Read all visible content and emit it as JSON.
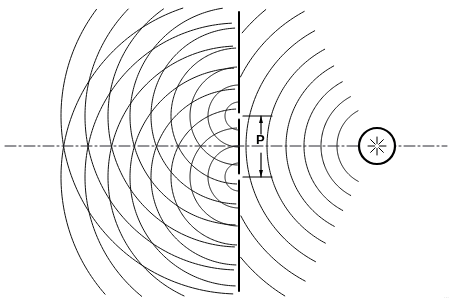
{
  "figure": {
    "kind": "optics-diagram",
    "background_color": "#ffffff",
    "line_color": "#000000"
  },
  "labels": {
    "slit_separation": "P",
    "corner_mark": "···"
  },
  "chart_data": {
    "type": "diagram",
    "grid": false,
    "legend": false,
    "xlim": [
      0,
      451
    ],
    "ylim": [
      0,
      301
    ],
    "axis_line": {
      "name": "optical-axis",
      "style": "dash-dot",
      "y": 146,
      "x_start": 5,
      "x_end": 447,
      "color": "#2b2b33",
      "width": 1
    },
    "source": {
      "name": "point-light-source",
      "cx": 377,
      "cy": 146,
      "radius": 18,
      "circle_width": 2.2,
      "starburst_rays": 8,
      "starburst_inner": 2.5,
      "starburst_outer": 9,
      "color": "#000000"
    },
    "barrier": {
      "name": "slit-barrier",
      "x": 239,
      "y_top": 12,
      "y_bottom": 291,
      "width": 2.0,
      "color": "#000000",
      "slits": [
        {
          "name": "slit-upper",
          "y": 116,
          "half_gap": 3.5
        },
        {
          "name": "slit-lower",
          "y": 177,
          "half_gap": 3.5
        }
      ]
    },
    "incident_wavefronts": {
      "name": "incident-spherical-waves",
      "description": "Arcs centered on the source, travelling right-to-left toward the barrier",
      "center_x": 377,
      "center_y": 146,
      "radii": [
        40,
        56,
        73,
        91,
        110,
        131,
        153,
        176
      ],
      "angle_start_deg": 118,
      "angle_end_deg": 242,
      "line_width": 1.0,
      "color": "#111111"
    },
    "diffracted_wavefronts": {
      "name": "diffracted-circular-waves",
      "description": "Two families of concentric circular wavelets emitted from each slit, interfering to the left of the barrier",
      "sources": [
        {
          "name": "wavelet-origin-upper",
          "cx": 239,
          "cy": 116
        },
        {
          "name": "wavelet-origin-lower",
          "cx": 239,
          "cy": 177
        }
      ],
      "radii": [
        14,
        31,
        49,
        68,
        88,
        109,
        131,
        154,
        178
      ],
      "angle_start_deg": 92,
      "angle_end_deg": 268,
      "line_width": 1.0,
      "color": "#111111"
    },
    "dimension": {
      "name": "slit-separation-dimension",
      "label": "P",
      "x": 261,
      "y_top": 116,
      "y_bottom": 177,
      "arrow_head_length": 7,
      "arrow_head_width": 4,
      "extension_left": 243,
      "extension_right": 272,
      "line_width": 1.2,
      "color": "#000000"
    }
  }
}
